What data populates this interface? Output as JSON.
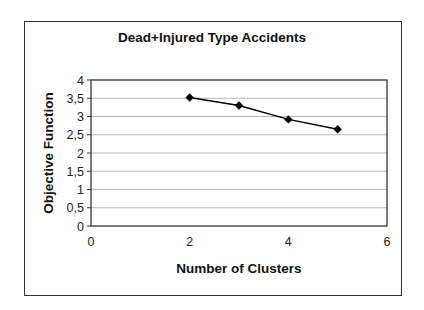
{
  "chart_data": {
    "type": "line",
    "title": "Dead+Injured Type Accidents",
    "xlabel": "Number of Clusters",
    "ylabel": "Objective Function",
    "x": [
      2,
      3,
      4,
      5
    ],
    "series": [
      {
        "name": "Objective Function",
        "values": [
          3.52,
          3.3,
          2.92,
          2.65
        ],
        "marker": "diamond",
        "color": "#000000"
      }
    ],
    "xlim": [
      0,
      6
    ],
    "ylim": [
      0,
      4
    ],
    "xticks": [
      "0",
      "2",
      "4",
      "6"
    ],
    "yticks": [
      "0",
      "0,5",
      "1",
      "1,5",
      "2",
      "2,5",
      "3",
      "3,5",
      "4"
    ],
    "grid": {
      "horizontal": true,
      "vertical": false
    },
    "legend": null
  }
}
